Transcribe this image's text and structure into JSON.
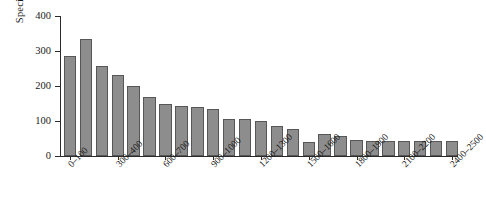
{
  "chart_data": {
    "type": "bar",
    "title": "",
    "xlabel": "",
    "ylabel": "Species richness",
    "ylim": [
      0,
      400
    ],
    "yticks": [
      0,
      100,
      200,
      300,
      400
    ],
    "ytick_labels": [
      "0",
      "100",
      "200",
      "300",
      "400"
    ],
    "grid": false,
    "legend": null,
    "bar_color": "#8d8d8d",
    "bar_edge_color": "#575757",
    "axis_color": "#2b2b2b",
    "categories": [
      "0–100",
      "100–200",
      "200–300",
      "300–400",
      "400–500",
      "500–600",
      "600–700",
      "700–800",
      "800–900",
      "900–1000",
      "1000–1100",
      "1100–1200",
      "1200–1300",
      "1300–1400",
      "1400–1500",
      "1500–1600",
      "1600–1700",
      "1700–1800",
      "1800–1900",
      "1900–2000",
      "2000–2100",
      "2100–2200",
      "2200–2300",
      "2300–2400",
      "2400–2500"
    ],
    "values": [
      286,
      334,
      257,
      232,
      199,
      170,
      148,
      144,
      140,
      133,
      106,
      106,
      100,
      86,
      78,
      40,
      64,
      58,
      46,
      42,
      42,
      42,
      42,
      42,
      42
    ],
    "visible_tick_labels": [
      "0–100",
      "300–400",
      "600–700",
      "900–1000",
      "1200–1300",
      "1500–1600",
      "1800–1900",
      "2100–2200",
      "2400–2500"
    ],
    "visible_tick_indices": [
      0,
      3,
      6,
      9,
      12,
      15,
      18,
      21,
      24
    ]
  }
}
